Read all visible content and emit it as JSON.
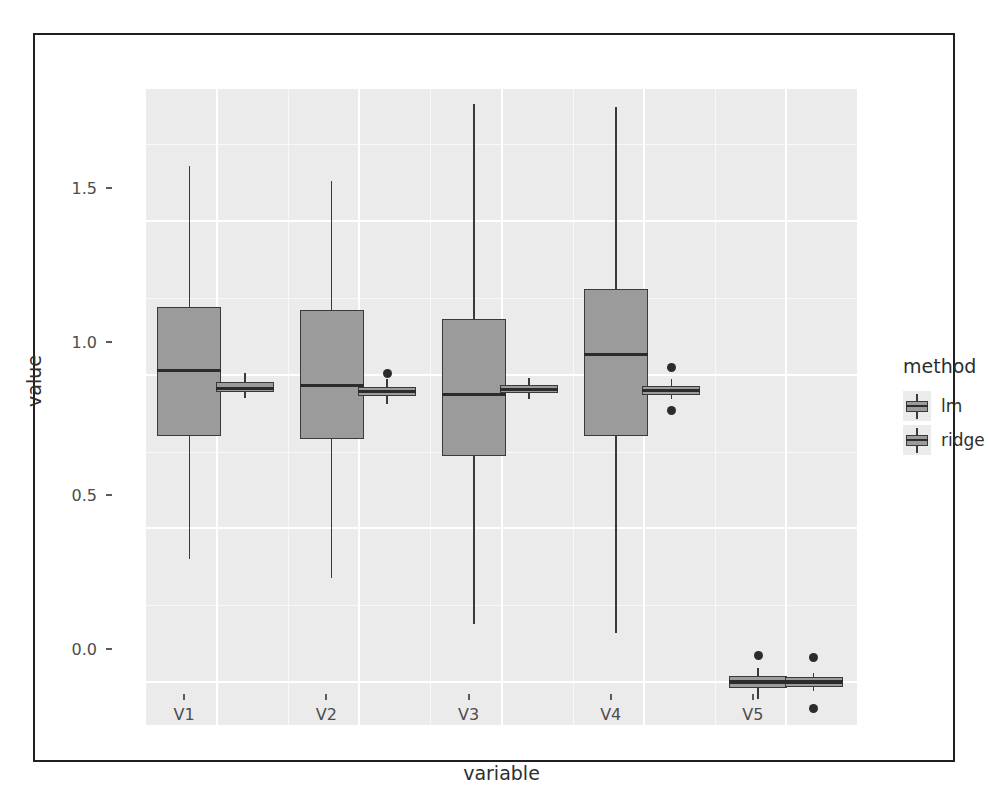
{
  "chart_data": {
    "type": "box",
    "title": "",
    "xlabel": "variable",
    "ylabel": "value",
    "categories": [
      "V1",
      "V2",
      "V3",
      "V4",
      "V5"
    ],
    "ytick_labels": [
      "0.0",
      "0.5",
      "1.0",
      "1.5"
    ],
    "ytick_values": [
      0.0,
      0.5,
      1.0,
      1.5
    ],
    "ylim": [
      -0.14,
      1.93
    ],
    "grid": true,
    "legend": {
      "title": "method",
      "position": "right",
      "entries": [
        {
          "label": "lm",
          "color": "#9b9b9b"
        },
        {
          "label": "ridge",
          "color": "#9b9b9b"
        }
      ]
    },
    "series": [
      {
        "name": "lm",
        "boxes": [
          {
            "category": "V1",
            "min": 0.4,
            "q1": 0.8,
            "median": 1.015,
            "q3": 1.22,
            "max": 1.68,
            "outliers": []
          },
          {
            "category": "V2",
            "min": 0.34,
            "q1": 0.79,
            "median": 0.965,
            "q3": 1.21,
            "max": 1.63,
            "outliers": []
          },
          {
            "category": "V3",
            "min": 0.19,
            "q1": 0.735,
            "median": 0.935,
            "q3": 1.18,
            "max": 1.88,
            "outliers": []
          },
          {
            "category": "V4",
            "min": 0.16,
            "q1": 0.8,
            "median": 1.065,
            "q3": 1.28,
            "max": 1.87,
            "outliers": []
          },
          {
            "category": "V5",
            "min": -0.055,
            "q1": -0.02,
            "median": 0.0,
            "q3": 0.02,
            "max": 0.045,
            "outliers": [
              0.085
            ]
          }
        ]
      },
      {
        "name": "ridge",
        "boxes": [
          {
            "category": "V1",
            "min": 0.925,
            "q1": 0.945,
            "median": 0.955,
            "q3": 0.975,
            "max": 1.005,
            "outliers": []
          },
          {
            "category": "V2",
            "min": 0.905,
            "q1": 0.93,
            "median": 0.945,
            "q3": 0.96,
            "max": 0.985,
            "outliers": [
              1.005
            ]
          },
          {
            "category": "V3",
            "min": 0.92,
            "q1": 0.94,
            "median": 0.952,
            "q3": 0.968,
            "max": 0.99,
            "outliers": []
          },
          {
            "category": "V4",
            "min": 0.92,
            "q1": 0.935,
            "median": 0.948,
            "q3": 0.962,
            "max": 0.985,
            "outliers": [
              1.025,
              0.885
            ]
          },
          {
            "category": "V5",
            "min": -0.03,
            "q1": -0.015,
            "median": 0.0,
            "q3": 0.015,
            "max": 0.03,
            "outliers": [
              0.08,
              -0.085
            ]
          }
        ]
      }
    ]
  },
  "axes": {
    "y_title": "value",
    "x_title": "variable"
  },
  "legend": {
    "title": "method",
    "items": [
      {
        "label": "lm"
      },
      {
        "label": "ridge"
      }
    ]
  },
  "ticks": {
    "y": [
      "1.5",
      "1.0",
      "0.5",
      "0.0"
    ],
    "x": [
      "V1",
      "V2",
      "V3",
      "V4",
      "V5"
    ]
  },
  "colors": {
    "panel_background": "#ebebeb",
    "grid_line": "#ffffff",
    "box_fill": "#9b9b9b",
    "box_outline": "#3a3a3a",
    "text": "#2e2e2e",
    "frame": "#231f20"
  }
}
